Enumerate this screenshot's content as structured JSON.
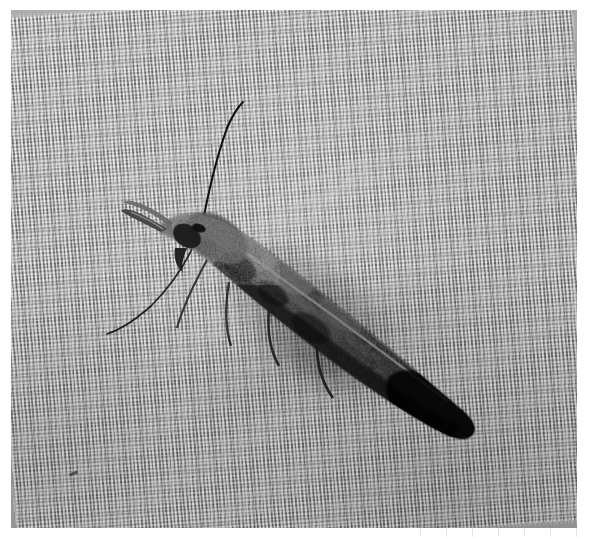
{
  "image": {
    "domain": "Natural-Image",
    "kind": "macro-photograph",
    "subject": "moth",
    "subject_description": "A small dark slender moth with narrow folded wings resting on woven fabric",
    "color_mode": "grayscale",
    "width_px": 589,
    "height_px": 539,
    "caption": "Moth resting on woven cloth",
    "alt_text": "Grayscale macro photograph of a small dark moth with long antennae resting on a finely woven grey fabric"
  },
  "frame": {
    "margin_color": "#ffffff",
    "margin_left_px": 11,
    "margin_top_px": 10,
    "photo_width_px": 566,
    "photo_height_px": 518
  },
  "background": {
    "name": "woven-fabric",
    "base_color": "#a9a9a9",
    "highlight_color": "#d2d2d2",
    "shadow_color": "#7c7c7c",
    "weave_angle_deg": -4,
    "weave_period_px": 3.6
  },
  "subject_parts": [
    {
      "name": "head",
      "label": "Head with labial palps"
    },
    {
      "name": "antenna-upper",
      "label": "Upper antenna"
    },
    {
      "name": "antenna-lower",
      "label": "Lower antenna"
    },
    {
      "name": "thorax",
      "label": "Thorax"
    },
    {
      "name": "forewings",
      "label": "Folded forewings"
    },
    {
      "name": "wing-tip",
      "label": "Wing tip"
    },
    {
      "name": "legs",
      "label": "Legs"
    }
  ],
  "palette": {
    "darkest": "#0a0a0a",
    "wing_mid": "#3b3b3b",
    "wing_light": "#9a9a9a",
    "background_mid": "#a9a9a9",
    "paper_white": "#ffffff"
  },
  "annotations": {
    "speck_label": "dust speck on fabric",
    "margin_marks_label": "faint scan marks"
  }
}
